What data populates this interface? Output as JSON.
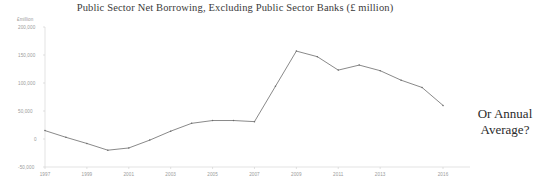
{
  "chart_data": {
    "type": "line",
    "title": "Public Sector Net Borrowing, Excluding Public Sector Banks (£ million)",
    "xlabel": "",
    "ylabel": "£million",
    "ylim": [
      -50000,
      200000
    ],
    "xlim": [
      1997,
      2016
    ],
    "grid": false,
    "legend": null,
    "yticks": [
      200000,
      150000,
      100000,
      50000,
      0,
      -50000
    ],
    "ytick_labels": [
      "200,000",
      "150,000",
      "100,000",
      "50,000",
      "0",
      "-50,000"
    ],
    "xticks": [
      1997,
      1999,
      2001,
      2003,
      2005,
      2007,
      2009,
      2011,
      2013,
      2016
    ],
    "xtick_labels": [
      "1997",
      "1999",
      "2001",
      "2003",
      "2005",
      "2007",
      "2009",
      "2011",
      "2013",
      "2016"
    ],
    "x": [
      1997,
      1998,
      1999,
      2000,
      2001,
      2002,
      2003,
      2004,
      2005,
      2006,
      2007,
      2008,
      2009,
      2010,
      2011,
      2012,
      2013,
      2014,
      2015,
      2016
    ],
    "values": [
      15000,
      3000,
      -8000,
      -20000,
      -16000,
      -2000,
      14000,
      28000,
      33000,
      33000,
      31000,
      94000,
      157000,
      147000,
      123000,
      132000,
      122000,
      105000,
      92000,
      60000
    ],
    "series_name": "Public Sector Net Borrowing",
    "line_color": "#6b6b6b"
  },
  "annotation": {
    "line1": "Or Annual",
    "line2": "Average?"
  },
  "axis": {
    "unit_label": "£million"
  }
}
